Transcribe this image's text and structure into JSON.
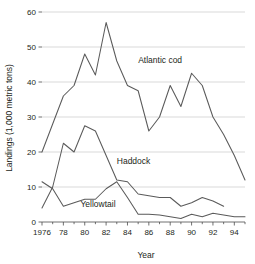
{
  "chart_data": {
    "type": "line",
    "title": "",
    "xlabel": "Year",
    "ylabel": "Landings (1,000 metric tons)",
    "xlim": [
      1976,
      1995
    ],
    "ylim": [
      0,
      60
    ],
    "grid": "horizontal",
    "legend_position": "inline-annotations",
    "y_ticks": [
      0,
      10,
      20,
      30,
      40,
      50,
      60
    ],
    "y_tick_labels": [
      "0",
      "10",
      "20",
      "30",
      "40",
      "50",
      "60"
    ],
    "x_ticks": [
      1976,
      1978,
      1980,
      1982,
      1984,
      1986,
      1988,
      1990,
      1992,
      1994
    ],
    "x_tick_labels": [
      "1976",
      "78",
      "80",
      "82",
      "84",
      "86",
      "88",
      "90",
      "92",
      "94"
    ],
    "x_minor_ticks": [
      1977,
      1979,
      1981,
      1983,
      1985,
      1987,
      1989,
      1991,
      1993,
      1995
    ],
    "series": [
      {
        "name": "Atlantic cod",
        "label": "Atlantic cod",
        "color": "#5a5a5a",
        "x": [
          1976,
          1977,
          1978,
          1979,
          1980,
          1981,
          1982,
          1983,
          1984,
          1985,
          1986,
          1987,
          1988,
          1989,
          1990,
          1991,
          1992,
          1993,
          1994,
          1995
        ],
        "values": [
          20.0,
          28.0,
          36.0,
          39.0,
          48.0,
          42.0,
          57.0,
          46.0,
          39.0,
          37.5,
          26.0,
          30.0,
          39.0,
          33.0,
          42.5,
          39.0,
          30.0,
          25.0,
          19.0,
          12.0
        ],
        "annotation": {
          "text": "Atlantic cod",
          "x": 1985.0,
          "y": 45.5
        }
      },
      {
        "name": "Haddock",
        "label": "Haddock",
        "color": "#5a5a5a",
        "x": [
          1976,
          1977,
          1978,
          1979,
          1980,
          1981,
          1982,
          1983,
          1984,
          1985,
          1986,
          1987,
          1988,
          1989,
          1990,
          1991,
          1992,
          1993
        ],
        "values": [
          4.0,
          10.0,
          22.5,
          20.0,
          27.5,
          26.0,
          19.0,
          12.0,
          11.5,
          8.0,
          7.5,
          7.0,
          7.0,
          4.5,
          5.5,
          7.0,
          6.0,
          4.5
        ],
        "annotation": {
          "text": "Haddock",
          "x": 1983.0,
          "y": 16.5
        }
      },
      {
        "name": "Yellowtail",
        "label": "Yellowtail",
        "color": "#5a5a5a",
        "x": [
          1976,
          1977,
          1978,
          1979,
          1980,
          1981,
          1982,
          1983,
          1984,
          1985,
          1986,
          1987,
          1988,
          1989,
          1990,
          1991,
          1992,
          1993,
          1994,
          1995
        ],
        "values": [
          11.5,
          9.5,
          4.5,
          5.5,
          6.5,
          6.5,
          9.5,
          11.5,
          7.0,
          2.2,
          2.2,
          2.0,
          1.5,
          1.0,
          2.2,
          1.5,
          2.5,
          2.0,
          1.5,
          1.5
        ],
        "annotation": {
          "text": "Yellowtail",
          "x": 1979.6,
          "y": 4.2
        }
      }
    ]
  },
  "axes": {
    "x_axis_title": "Year",
    "y_axis_title": "Landings (1,000 metric tons)"
  },
  "colors": {
    "line": "#5a5a5a",
    "grid": "#c9c9c9",
    "axis": "#4d4d4d",
    "text": "#231f20",
    "background": "#ffffff"
  }
}
